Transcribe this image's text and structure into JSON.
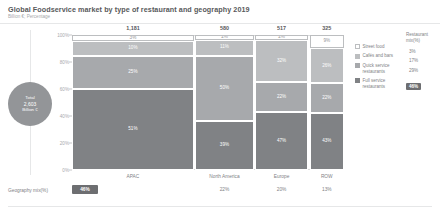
{
  "header": {
    "title": "Global Foodservice market by type of restaurant and geography 2019",
    "subtitle": "Billion €; Percentage"
  },
  "total_bubble": {
    "label": "Total",
    "value": "2,603",
    "unit": "Billion €"
  },
  "axis": {
    "y_ticks": [
      "100%",
      "80%",
      "60%",
      "40%",
      "20%",
      "0%"
    ],
    "y_values": [
      100,
      80,
      60,
      40,
      20,
      0
    ]
  },
  "legend": {
    "items": [
      {
        "label": "Street food",
        "color": "#ffffff",
        "swatch": "sw-street"
      },
      {
        "label": "Cafés and bars",
        "color": "#bcbec0",
        "swatch": "sw-cafe"
      },
      {
        "label": "Quick service restaurants",
        "color": "#a7a9ac",
        "swatch": "sw-quick"
      },
      {
        "label": "Full service restaurants",
        "color": "#808285",
        "swatch": "sw-full"
      }
    ],
    "mix_header": "Restaurant mix(%)",
    "mix_values": [
      "3%",
      "17%",
      "29%",
      "46%"
    ],
    "mix_highlight_index": 3
  },
  "bottom_row": {
    "label": "Geography mix(%)",
    "values": [
      "46%",
      "22%",
      "20%",
      "13%"
    ],
    "highlight_index": 0
  },
  "chart_data": {
    "type": "bar",
    "variant": "marimekko",
    "title": "Global Foodservice market by type of restaurant and geography 2019",
    "subtitle": "Billion €; Percentage",
    "xlabel": "",
    "ylabel": "",
    "ylim": [
      0,
      100
    ],
    "grid": false,
    "legend_position": "right",
    "total": 2603,
    "total_unit": "Billion €",
    "categories": [
      "APAC",
      "North America",
      "Europe",
      "ROW"
    ],
    "column_totals": [
      "1,181",
      "580",
      "517",
      "325"
    ],
    "column_total_values": [
      1181,
      580,
      517,
      325
    ],
    "column_widths_pct": [
      46,
      22,
      20,
      13
    ],
    "geography_mix_labels": [
      "46%",
      "22%",
      "20%",
      "13%"
    ],
    "restaurant_mix_labels": [
      "3%",
      "17%",
      "29%",
      "46%"
    ],
    "series": [
      {
        "name": "Street food",
        "color": "#ffffff",
        "values": [
          3,
          2,
          2,
          9
        ],
        "labels": [
          "3%",
          "2%",
          "2%",
          "9%"
        ]
      },
      {
        "name": "Cafés and bars",
        "color": "#bcbec0",
        "values": [
          10,
          11,
          32,
          26
        ],
        "labels": [
          "10%",
          "11%",
          "32%",
          "26%"
        ]
      },
      {
        "name": "Quick service restaurants",
        "color": "#a7a9ac",
        "values": [
          25,
          50,
          22,
          22
        ],
        "labels": [
          "25%",
          "50%",
          "22%",
          "22%"
        ]
      },
      {
        "name": "Full service restaurants",
        "color": "#808285",
        "values": [
          62,
          37,
          44,
          43
        ],
        "labels": [
          "51%",
          "39%",
          "47%",
          "43%"
        ]
      }
    ]
  }
}
